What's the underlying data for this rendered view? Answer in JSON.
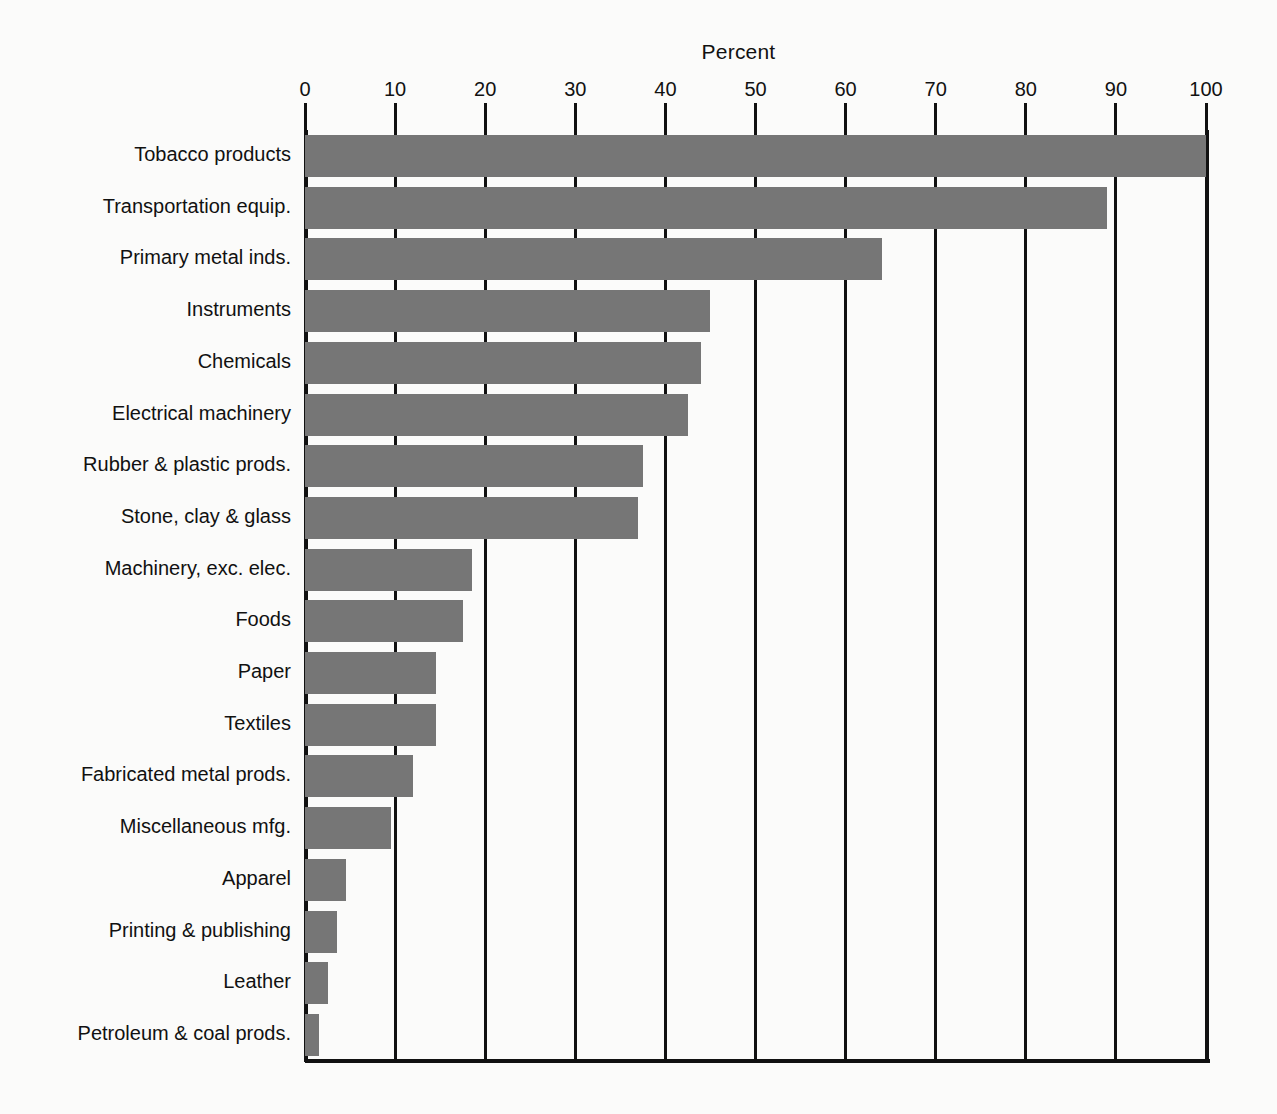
{
  "chart": {
    "axis_title": "Percent",
    "x_tick_labels": [
      "0",
      "10",
      "20",
      "30",
      "40",
      "50",
      "60",
      "70",
      "80",
      "90",
      "100"
    ],
    "bar_color": "#767676",
    "axis_color": "#111111",
    "background": "#fbfbfa"
  },
  "chart_data": {
    "type": "bar",
    "orientation": "horizontal",
    "title": "",
    "xlabel": "Percent",
    "ylabel": "",
    "xlim": [
      0,
      100
    ],
    "xticks": [
      0,
      10,
      20,
      30,
      40,
      50,
      60,
      70,
      80,
      90,
      100
    ],
    "grid": true,
    "legend": false,
    "categories": [
      "Tobacco products",
      "Transportation equip.",
      "Primary metal inds.",
      "Instruments",
      "Chemicals",
      "Electrical machinery",
      "Rubber & plastic prods.",
      "Stone, clay & glass",
      "Machinery, exc. elec.",
      "Foods",
      "Paper",
      "Textiles",
      "Fabricated metal prods.",
      "Miscellaneous mfg.",
      "Apparel",
      "Printing & publishing",
      "Leather",
      "Petroleum & coal prods."
    ],
    "values": [
      100,
      89,
      64,
      45,
      44,
      42.5,
      37.5,
      37,
      18.5,
      17.5,
      14.5,
      14.5,
      12,
      9.5,
      4.5,
      3.5,
      2.5,
      1.5
    ]
  },
  "labels": {
    "0": "Tobacco products",
    "1": "Transportation equip.",
    "2": "Primary metal inds.",
    "3": "Instruments",
    "4": "Chemicals",
    "5": "Electrical machinery",
    "6": "Rubber & plastic prods.",
    "7": "Stone, clay & glass",
    "8": "Machinery, exc. elec.",
    "9": "Foods",
    "10": "Paper",
    "11": "Textiles",
    "12": "Fabricated metal prods.",
    "13": "Miscellaneous mfg.",
    "14": "Apparel",
    "15": "Printing & publishing",
    "16": "Leather",
    "17": "Petroleum & coal prods."
  }
}
